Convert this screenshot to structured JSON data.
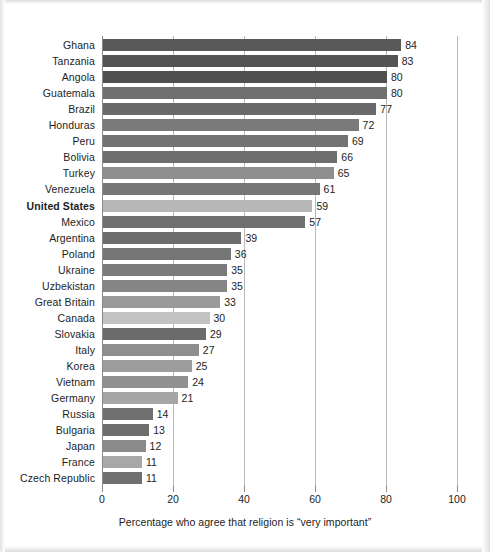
{
  "chart_data": {
    "type": "bar",
    "orientation": "horizontal",
    "title": "",
    "xlabel": "Percentage who agree that religion is “very important”",
    "ylabel": "",
    "xlim": [
      0,
      100
    ],
    "xticks": [
      0,
      20,
      40,
      60,
      80,
      100
    ],
    "xtick_labels": [
      "0",
      "20",
      "40",
      "60",
      "80",
      "100"
    ],
    "grid": true,
    "legend": "none",
    "categories": [
      "Ghana",
      "Tanzania",
      "Angola",
      "Guatemala",
      "Brazil",
      "Honduras",
      "Peru",
      "Bolivia",
      "Turkey",
      "Venezuela",
      "United States",
      "Mexico",
      "Argentina",
      "Poland",
      "Ukraine",
      "Uzbekistan",
      "Great Britain",
      "Canada",
      "Slovakia",
      "Italy",
      "Korea",
      "Vietnam",
      "Germany",
      "Russia",
      "Bulgaria",
      "Japan",
      "France",
      "Czech Republic"
    ],
    "values": [
      84,
      83,
      80,
      80,
      77,
      72,
      69,
      66,
      65,
      61,
      59,
      57,
      39,
      36,
      35,
      35,
      33,
      30,
      29,
      27,
      25,
      24,
      21,
      14,
      13,
      12,
      11,
      11
    ],
    "bar_colors": [
      "#595959",
      "#545454",
      "#4f4f4f",
      "#707070",
      "#6a6a6a",
      "#7a7a7a",
      "#737373",
      "#6e6e6e",
      "#8f8f8f",
      "#767676",
      "#b8b8b8",
      "#6f6f6f",
      "#6d6d6d",
      "#767676",
      "#7b7b7b",
      "#858585",
      "#9a9a9a",
      "#c2c2c2",
      "#6b6b6b",
      "#8e8e8e",
      "#9d9d9d",
      "#919191",
      "#a6a6a6",
      "#707070",
      "#6e6e6e",
      "#8b8b8b",
      "#a8a8a8",
      "#707070"
    ],
    "highlight_category": "United States"
  },
  "axis": {
    "caption": "Percentage who agree that religion is “very important”"
  }
}
